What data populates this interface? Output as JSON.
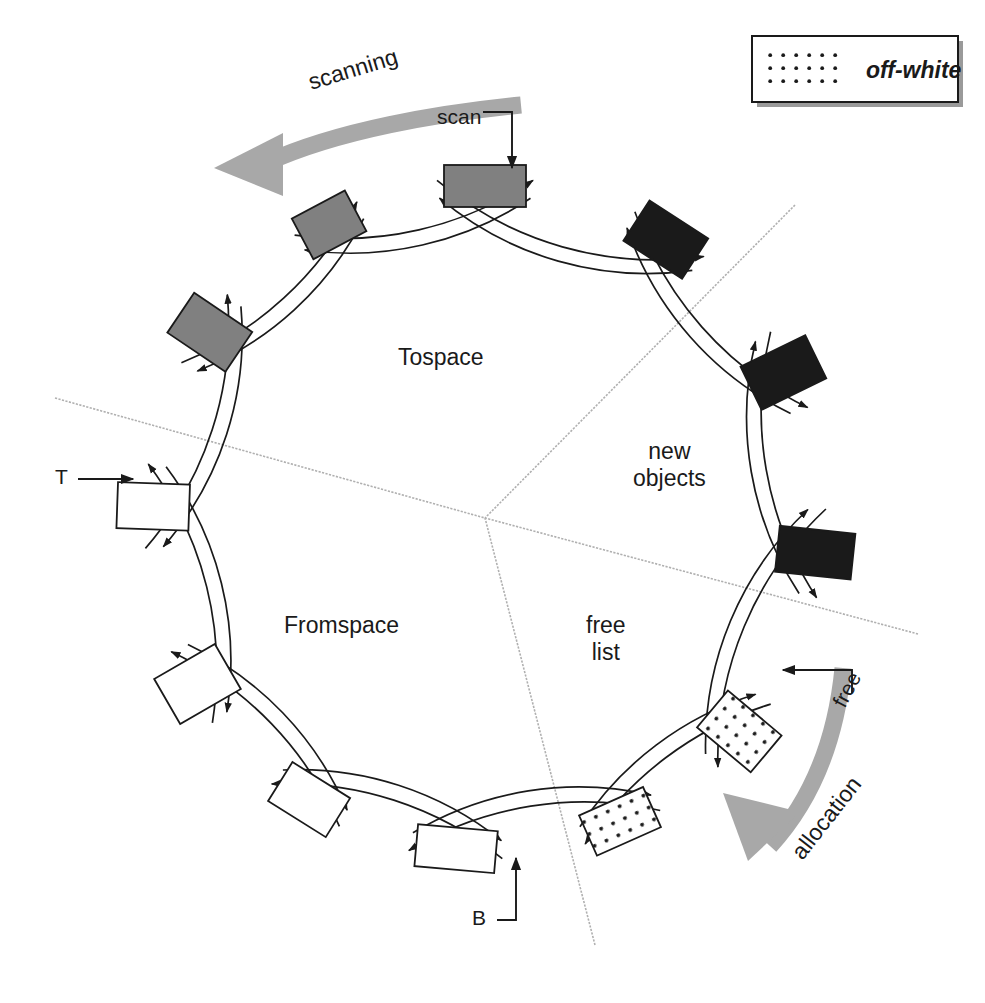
{
  "diagram": {
    "sectors": [
      {
        "id": "tospace",
        "label": "Tospace",
        "x": 398,
        "y": 344
      },
      {
        "id": "fromspace",
        "label": "Fromspace",
        "x": 284,
        "y": 612
      },
      {
        "id": "new",
        "label_line1": "new",
        "label_line2": "objects",
        "x": 633,
        "y": 438
      },
      {
        "id": "free",
        "label_line1": "free",
        "label_line2": "list",
        "x": 586,
        "y": 612
      }
    ],
    "pointers": [
      {
        "id": "scan",
        "label": "scan",
        "x": 437,
        "y": 105
      },
      {
        "id": "t",
        "label": "T",
        "x": 55,
        "y": 465
      },
      {
        "id": "b",
        "label": "B",
        "x": 472,
        "y": 912
      },
      {
        "id": "free-ptr",
        "label": "free",
        "x": 828,
        "y": 700,
        "rotation": -62
      }
    ],
    "flow_labels": [
      {
        "id": "scanning",
        "label": "scanning",
        "x": 305,
        "y": 58,
        "rotation": -17
      },
      {
        "id": "allocation",
        "label": "allocation",
        "x": 793,
        "y": 838,
        "rotation": -52
      }
    ],
    "legend": {
      "swatch_name": "dotted-swatch",
      "label": "off-white",
      "x": 752,
      "y": 36,
      "w": 206,
      "h": 66
    },
    "colors": {
      "black_cell": "#1a1a1a",
      "gray_cell": "#808080",
      "white_cell": "#ffffff",
      "dotted_cell": "#ffffff",
      "dot_color": "#1a1a1a",
      "outline": "#1a1a1a",
      "flow_arrow": "#a8a8a8",
      "divider": "#b0b0b0"
    },
    "ring": {
      "center_x": 485,
      "center_y": 518,
      "radius": 332,
      "cells": [
        {
          "id": "c01",
          "angle": -90,
          "w": 82,
          "h": 42,
          "fill": "gray",
          "name": "cell-scan-target"
        },
        {
          "id": "c02",
          "angle": -118,
          "w": 60,
          "h": 46,
          "fill": "gray",
          "name": "cell-gray-2"
        },
        {
          "id": "c03",
          "angle": -146,
          "w": 48,
          "h": 70,
          "fill": "gray",
          "name": "cell-gray-3"
        },
        {
          "id": "c04",
          "angle": -178,
          "w": 46,
          "h": 72,
          "fill": "white",
          "name": "cell-t-target"
        },
        {
          "id": "c05",
          "angle": 150,
          "w": 52,
          "h": 70,
          "fill": "white",
          "name": "cell-white-2"
        },
        {
          "id": "c06",
          "angle": 122,
          "w": 68,
          "h": 46,
          "fill": "white",
          "name": "cell-white-3"
        },
        {
          "id": "c07",
          "angle": 95,
          "w": 80,
          "h": 42,
          "fill": "white",
          "name": "cell-b-target"
        },
        {
          "id": "c08",
          "angle": 66,
          "w": 70,
          "h": 44,
          "fill": "dotted",
          "name": "cell-free-2"
        },
        {
          "id": "c09",
          "angle": 40,
          "w": 48,
          "h": 70,
          "fill": "dotted",
          "name": "cell-free-1"
        },
        {
          "id": "c10",
          "angle": 6,
          "w": 46,
          "h": 76,
          "fill": "black",
          "name": "cell-black-3"
        },
        {
          "id": "c11",
          "angle": -26,
          "w": 48,
          "h": 72,
          "fill": "black",
          "name": "cell-black-2"
        },
        {
          "id": "c12",
          "angle": -57,
          "w": 70,
          "h": 48,
          "fill": "black",
          "name": "cell-black-1"
        }
      ],
      "dividers": [
        {
          "id": "div-tospace-fromspace",
          "x1": 55,
          "y1": 398,
          "x2": 485,
          "y2": 518
        },
        {
          "id": "div-tospace-new",
          "x1": 795,
          "y1": 205,
          "x2": 485,
          "y2": 518
        },
        {
          "id": "div-new-free",
          "x1": 918,
          "y1": 634,
          "x2": 485,
          "y2": 518
        },
        {
          "id": "div-fromspace-free",
          "x1": 595,
          "y1": 945,
          "x2": 485,
          "y2": 518
        }
      ]
    }
  }
}
